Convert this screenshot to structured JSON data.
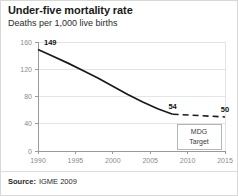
{
  "title": "Under-five mortality rate",
  "subtitle": "Deaths per 1,000 live births",
  "source": {
    "label": "Source:",
    "value": "IGME 2009"
  },
  "legend": {
    "mdg_line1": "MDG",
    "mdg_line2": "Target"
  },
  "colors": {
    "line": "#1a1a1a",
    "grid": "#e4e4e4",
    "axis": "#9a9a9a",
    "tick_text": "#8a8a8a",
    "frame": "#d8d8d8"
  },
  "chart_data": {
    "type": "line",
    "title": "Under-five mortality rate",
    "subtitle": "Deaths per 1,000 live births",
    "xlabel": "",
    "ylabel": "Deaths per 1,000 live births",
    "xlim": [
      1990,
      2015
    ],
    "ylim": [
      0,
      160
    ],
    "xticks": [
      "1990",
      "1995",
      "2000",
      "2005",
      "2010",
      "2015"
    ],
    "yticks": [
      "0",
      "40",
      "80",
      "120",
      "160"
    ],
    "grid": true,
    "legend_position": "bottom-right",
    "series": [
      {
        "name": "Observed under-five mortality rate",
        "style": "solid",
        "x": [
          1990,
          1992,
          1994,
          1996,
          1998,
          2000,
          2002,
          2004,
          2006,
          2008
        ],
        "values": [
          149,
          139,
          129,
          118,
          107,
          95,
          83,
          72,
          62,
          54
        ]
      },
      {
        "name": "MDG Target",
        "style": "dashed",
        "x": [
          2008,
          2015
        ],
        "values": [
          54,
          50
        ]
      }
    ],
    "annotations": [
      {
        "text": "149",
        "x": 1990,
        "y": 149
      },
      {
        "text": "54",
        "x": 2008,
        "y": 54
      },
      {
        "text": "50",
        "x": 2015,
        "y": 50
      }
    ]
  }
}
